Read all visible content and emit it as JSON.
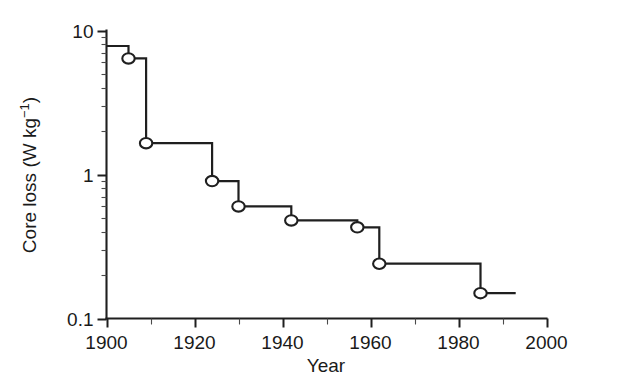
{
  "chart_data": {
    "type": "line",
    "subtype": "step-post",
    "title": "",
    "xlabel": "Year",
    "ylabel": "Core loss (W kg−1)",
    "ylabel_parts": {
      "main": "Core loss (W kg",
      "exponent": "−1",
      "tail": ")"
    },
    "xlim": [
      1900,
      2000
    ],
    "ylim": [
      0.1,
      10
    ],
    "yscale": "log",
    "xscale": "linear",
    "grid": false,
    "legend": null,
    "x_ticks_major": [
      1900,
      1920,
      1940,
      1960,
      1980,
      2000
    ],
    "x_tick_labels": [
      "1900",
      "1920",
      "1940",
      "1960",
      "1980",
      "2000"
    ],
    "x_ticks_minor": [
      1910,
      1930,
      1950,
      1970,
      1990
    ],
    "y_ticks_major": [
      10,
      1,
      0.1
    ],
    "y_tick_labels": [
      "10",
      "1",
      "0.1"
    ],
    "y_ticks_minor": [
      9,
      8,
      7,
      6,
      5,
      4,
      3,
      2,
      0.9,
      0.8,
      0.7,
      0.6,
      0.5,
      0.4,
      0.3,
      0.2
    ],
    "marker_style": "open-circle",
    "line_color": "#1f1f1f",
    "marker_fill": "#ffffff",
    "background": "#ffffff",
    "series_start": {
      "x": 1900,
      "y": 7.8
    },
    "series_end": {
      "x": 1993,
      "y": 0.15
    },
    "points": [
      {
        "x": 1905,
        "y": 6.4
      },
      {
        "x": 1909,
        "y": 1.65
      },
      {
        "x": 1924,
        "y": 0.9
      },
      {
        "x": 1930,
        "y": 0.6
      },
      {
        "x": 1942,
        "y": 0.48
      },
      {
        "x": 1957,
        "y": 0.43
      },
      {
        "x": 1962,
        "y": 0.24
      },
      {
        "x": 1985,
        "y": 0.15
      }
    ]
  }
}
